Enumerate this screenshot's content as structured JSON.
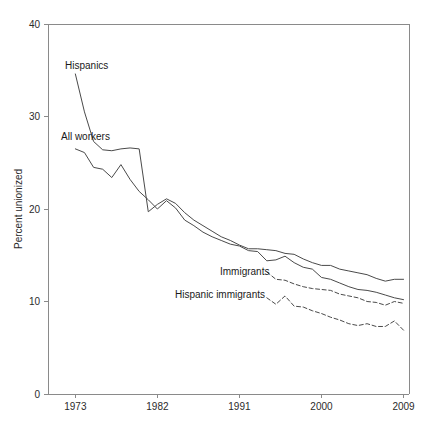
{
  "chart_data": {
    "type": "line",
    "title": "",
    "xlabel": "",
    "ylabel": "Percent unionized",
    "xlim": [
      1970,
      2009
    ],
    "ylim": [
      0,
      40
    ],
    "grid": false,
    "legend_position": "inline-annotations",
    "xticks": [
      1973,
      1982,
      1991,
      2000,
      2009
    ],
    "xtick_labels": [
      "1973",
      "1982",
      "1991",
      "2000",
      "2009"
    ],
    "yticks": [
      0,
      10,
      20,
      30,
      40
    ],
    "ytick_labels": [
      "0",
      "10",
      "20",
      "30",
      "40"
    ],
    "series": [
      {
        "name": "Hispanics",
        "style": "solid",
        "color": "#4a4a4a",
        "x": [
          1973,
          1974,
          1975,
          1976,
          1977,
          1978,
          1979,
          1980,
          1981,
          1982,
          1983,
          1984,
          1985,
          1986,
          1987,
          1988,
          1989,
          1990,
          1991,
          1992,
          1993,
          1994,
          1995,
          1996,
          1997,
          1998,
          1999,
          2000,
          2001,
          2002,
          2003,
          2004,
          2005,
          2006,
          2007,
          2008,
          2009
        ],
        "values": [
          34.6,
          30.5,
          27.3,
          26.4,
          26.3,
          26.5,
          26.6,
          26.5,
          19.7,
          20.5,
          21.1,
          20.6,
          19.6,
          18.8,
          18.2,
          17.6,
          17.0,
          16.6,
          16.1,
          15.7,
          15.7,
          15.6,
          15.5,
          15.2,
          15.1,
          14.6,
          14.2,
          13.9,
          13.9,
          13.5,
          13.3,
          13.1,
          12.9,
          12.5,
          12.2,
          12.4,
          12.4
        ]
      },
      {
        "name": "All workers",
        "style": "solid",
        "color": "#4a4a4a",
        "x": [
          1973,
          1974,
          1975,
          1976,
          1977,
          1978,
          1979,
          1980,
          1981,
          1982,
          1983,
          1984,
          1985,
          1986,
          1987,
          1988,
          1989,
          1990,
          1991,
          1992,
          1993,
          1994,
          1995,
          1996,
          1997,
          1998,
          1999,
          2000,
          2001,
          2002,
          2003,
          2004,
          2005,
          2006,
          2007,
          2008,
          2009
        ],
        "values": [
          26.5,
          26.1,
          24.5,
          24.3,
          23.4,
          24.8,
          23.2,
          21.9,
          21.0,
          20.0,
          20.9,
          20.1,
          18.8,
          18.2,
          17.5,
          17.0,
          16.6,
          16.2,
          16.0,
          15.5,
          15.4,
          14.4,
          14.5,
          14.9,
          14.2,
          13.7,
          13.5,
          12.6,
          12.4,
          12.0,
          11.6,
          11.3,
          11.2,
          11.0,
          10.7,
          10.4,
          10.2
        ]
      },
      {
        "name": "Immigrants",
        "style": "dashed",
        "color": "#4a4a4a",
        "x": [
          1994,
          1995,
          1996,
          1997,
          1998,
          1999,
          2000,
          2001,
          2002,
          2003,
          2004,
          2005,
          2006,
          2007,
          2008,
          2009
        ],
        "values": [
          13.2,
          12.4,
          12.3,
          11.9,
          11.6,
          11.4,
          11.3,
          11.2,
          10.8,
          10.6,
          10.4,
          10.0,
          9.9,
          9.6,
          10.0,
          9.8
        ]
      },
      {
        "name": "Hispanic immigrants",
        "style": "dashed",
        "color": "#4a4a4a",
        "x": [
          1994,
          1995,
          1996,
          1997,
          1998,
          1999,
          2000,
          2001,
          2002,
          2003,
          2004,
          2005,
          2006,
          2007,
          2008,
          2009
        ],
        "values": [
          10.4,
          9.7,
          10.6,
          9.5,
          9.4,
          9.0,
          8.7,
          8.3,
          8.0,
          7.6,
          7.4,
          7.6,
          7.3,
          7.3,
          7.9,
          6.9
        ]
      }
    ],
    "annotations": [
      {
        "label": "Hispanics",
        "series": "Hispanics",
        "x_px": 65,
        "y_px": 69,
        "anchor": "start"
      },
      {
        "label": "All workers",
        "series": "All workers",
        "x_px": 61,
        "y_px": 140,
        "anchor": "start"
      },
      {
        "label": "Immigrants",
        "series": "Immigrants",
        "x_px": 220,
        "y_px": 275,
        "anchor": "start"
      },
      {
        "label": "Hispanic immigrants",
        "series": "Hispanic immigrants",
        "x_px": 175,
        "y_px": 298,
        "anchor": "start"
      }
    ]
  }
}
